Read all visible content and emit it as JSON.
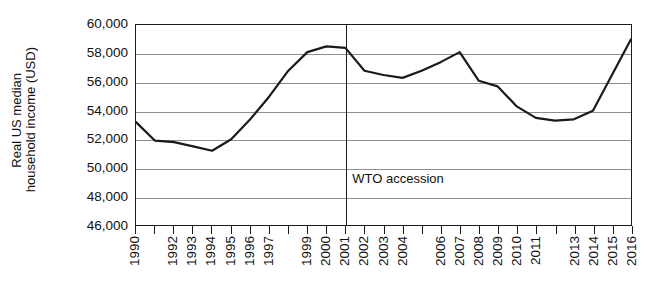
{
  "chart_data": {
    "type": "line",
    "title": "",
    "subtitle": "",
    "xlabel": "",
    "ylabel": "Real US median household income (USD)",
    "ylabel_lines": [
      "Real US median",
      "household income (USD)"
    ],
    "ylim": [
      46000,
      60000
    ],
    "ytick_values": [
      60000,
      58000,
      56000,
      54000,
      52000,
      50000,
      48000,
      46000
    ],
    "ytick_labels": [
      "60,000",
      "58,000",
      "56,000",
      "54,000",
      "52,000",
      "50,000",
      "48,000",
      "46,000"
    ],
    "grid": true,
    "grid_axis": "y",
    "legend": false,
    "legend_position": "none",
    "x": [
      1990,
      1991,
      1992,
      1993,
      1994,
      1995,
      1996,
      1997,
      1998,
      1999,
      2000,
      2001,
      2002,
      2003,
      2004,
      2005,
      2006,
      2007,
      2008,
      2009,
      2010,
      2011,
      2012,
      2013,
      2014,
      2015,
      2016
    ],
    "xtick_labels": [
      "1990",
      "",
      "1992",
      "1993",
      "1994",
      "1995",
      "1996",
      "1997",
      "",
      "1999",
      "2000",
      "2001",
      "2002",
      "2003",
      "2004",
      "",
      "2006",
      "2007",
      "2008",
      "2009",
      "2010",
      "2011",
      "",
      "2013",
      "2014",
      "2015",
      "2016"
    ],
    "series": [
      {
        "name": "Real US median household income (USD)",
        "color": "#1a1a1a",
        "values": [
          53200,
          51900,
          51800,
          51500,
          51200,
          52000,
          53400,
          55000,
          56800,
          58100,
          58500,
          58400,
          56800,
          56500,
          56300,
          56800,
          57400,
          58100,
          56100,
          55700,
          54300,
          53500,
          53300,
          53400,
          54000,
          56500,
          59000
        ]
      }
    ],
    "annotations": [
      {
        "name": "wto-accession",
        "label": "WTO accession",
        "type": "vline",
        "x": 2001,
        "value": 2001,
        "label_y": 49300,
        "color": "#1a1a1a"
      }
    ],
    "colors": {
      "line": "#1a1a1a",
      "grid": "#8e8e8e",
      "axis": "#1a1a1a",
      "background": "#ffffff",
      "text": "#111111"
    }
  }
}
